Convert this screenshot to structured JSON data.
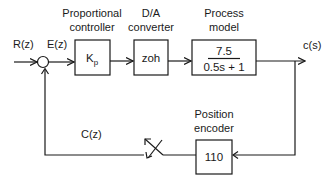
{
  "diagram": {
    "signals": {
      "input": "R(z)",
      "error": "E(z)",
      "output": "c(s)",
      "feedback": "C(z)"
    },
    "blocks": {
      "controller": {
        "title_line1": "Proportional",
        "title_line2": "controller",
        "content_main": "K",
        "content_sub": "p"
      },
      "dac": {
        "title_line1": "D/A",
        "title_line2": "converter",
        "content": "zoh"
      },
      "process": {
        "title_line1": "Process",
        "title_line2": "model",
        "numerator": "7.5",
        "denominator": "0.5s + 1"
      },
      "encoder": {
        "title_line1": "Position",
        "title_line2": "encoder",
        "content": "110"
      }
    },
    "summing_junction": {
      "type": "circle"
    },
    "sampler": {
      "type": "switch"
    }
  }
}
